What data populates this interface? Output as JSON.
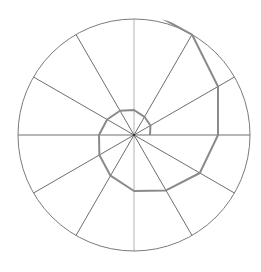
{
  "diagram": {
    "type": "polar-spiral",
    "center": [
      134,
      135
    ],
    "radius": 116,
    "spoke_angles_deg": [
      0,
      30,
      60,
      90,
      120,
      150,
      180,
      210,
      240,
      270,
      300,
      330
    ],
    "colors": {
      "background": "#ffffff",
      "circle": "#7a7a7a",
      "spoke": "#6e6e6e",
      "vertical_axis": "#b4b4b4",
      "spiral": "#8a8a8a"
    },
    "spiral_points": [
      {
        "angle_deg": 0,
        "r": 16
      },
      {
        "angle_deg": 30,
        "r": 19
      },
      {
        "angle_deg": 60,
        "r": 21
      },
      {
        "angle_deg": 90,
        "r": 25
      },
      {
        "angle_deg": 120,
        "r": 28
      },
      {
        "angle_deg": 150,
        "r": 31
      },
      {
        "angle_deg": 180,
        "r": 35
      },
      {
        "angle_deg": 210,
        "r": 40
      },
      {
        "angle_deg": 240,
        "r": 47
      },
      {
        "angle_deg": 270,
        "r": 56
      },
      {
        "angle_deg": 300,
        "r": 64
      },
      {
        "angle_deg": 330,
        "r": 76
      },
      {
        "angle_deg": 360,
        "r": 84
      },
      {
        "angle_deg": 390,
        "r": 97
      },
      {
        "angle_deg": 420,
        "r": 116
      },
      {
        "angle_deg": 450,
        "r": 132
      }
    ]
  }
}
